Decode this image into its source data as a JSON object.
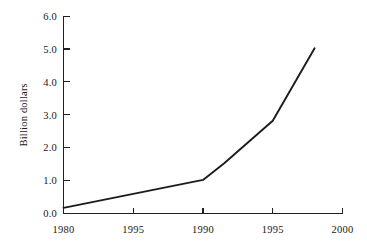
{
  "chart_data": {
    "type": "line",
    "title": "",
    "subtitle": "",
    "xlabel": "",
    "ylabel": "Billion dollars",
    "xlim": [
      1980,
      2000
    ],
    "ylim": [
      0.0,
      6.0
    ],
    "grid": false,
    "legend": null,
    "legend_position": "none",
    "x_tick_labels": [
      "1980",
      "1995",
      "1990",
      "1995",
      "2000"
    ],
    "x_tick_values": [
      1980,
      1985,
      1990,
      1995,
      2000
    ],
    "y_tick_labels": [
      "0.0",
      "1.0",
      "2.0",
      "3.0",
      "4.0",
      "5.0",
      "6.0"
    ],
    "y_tick_values": [
      0.0,
      1.0,
      2.0,
      3.0,
      4.0,
      5.0,
      6.0
    ],
    "series": [
      {
        "name": "Billion dollars",
        "color": "#1c1c1b",
        "x": [
          1980.0,
          1990.0,
          1991.5,
          1995.0,
          1998.0
        ],
        "values": [
          0.17,
          1.02,
          1.52,
          2.82,
          5.02
        ]
      }
    ]
  },
  "figure": {
    "background_color": "#ffffff",
    "line_color": "#1c1c1b",
    "axis_color": "#20201f"
  }
}
